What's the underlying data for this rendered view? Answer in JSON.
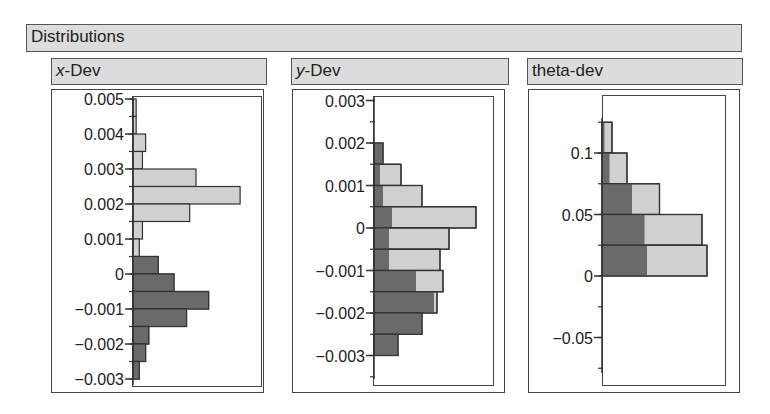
{
  "section": {
    "title": "Distributions"
  },
  "panels": [
    {
      "title_italic": "x",
      "title_rest": "-Dev"
    },
    {
      "title_italic": "y",
      "title_rest": "-Dev"
    },
    {
      "title_italic": "",
      "title_rest": "theta-dev"
    }
  ],
  "colors": {
    "light_bar": "#d0d0d0",
    "dark_bar": "#6a6a6a",
    "header_bg": "#dcdcdc",
    "border": "#444444"
  },
  "chart_data": [
    {
      "type": "bar",
      "orientation": "horizontal-histogram",
      "title": "x-Dev",
      "ylabel": "x-Dev",
      "ylim": [
        -0.0032,
        0.0052
      ],
      "tick_labels": [
        "0.005",
        "0.004",
        "0.003",
        "0.002",
        "0.001",
        "0",
        "−0.001",
        "−0.002",
        "−0.003"
      ],
      "tick_values": [
        0.005,
        0.004,
        0.003,
        0.002,
        0.001,
        0,
        -0.001,
        -0.002,
        -0.003
      ],
      "bins": [
        {
          "low": 0.0045,
          "high": 0.005,
          "total": 1,
          "dark": 0
        },
        {
          "low": 0.004,
          "high": 0.0045,
          "total": 1,
          "dark": 0
        },
        {
          "low": 0.0035,
          "high": 0.004,
          "total": 4,
          "dark": 0
        },
        {
          "low": 0.003,
          "high": 0.0035,
          "total": 3,
          "dark": 0
        },
        {
          "low": 0.0025,
          "high": 0.003,
          "total": 20,
          "dark": 0
        },
        {
          "low": 0.002,
          "high": 0.0025,
          "total": 34,
          "dark": 0
        },
        {
          "low": 0.0015,
          "high": 0.002,
          "total": 18,
          "dark": 0
        },
        {
          "low": 0.001,
          "high": 0.0015,
          "total": 3,
          "dark": 0
        },
        {
          "low": 0.0005,
          "high": 0.001,
          "total": 2,
          "dark": 0
        },
        {
          "low": 0.0,
          "high": 0.0005,
          "total": 8,
          "dark": 8
        },
        {
          "low": -0.0005,
          "high": 0.0,
          "total": 13,
          "dark": 13
        },
        {
          "low": -0.001,
          "high": -0.0005,
          "total": 24,
          "dark": 24
        },
        {
          "low": -0.0015,
          "high": -0.001,
          "total": 17,
          "dark": 17
        },
        {
          "low": -0.002,
          "high": -0.0015,
          "total": 5,
          "dark": 5
        },
        {
          "low": -0.0025,
          "high": -0.002,
          "total": 4,
          "dark": 4
        },
        {
          "low": -0.003,
          "high": -0.0025,
          "total": 2,
          "dark": 2
        }
      ]
    },
    {
      "type": "bar",
      "orientation": "horizontal-histogram",
      "title": "y-Dev",
      "ylabel": "y-Dev",
      "ylim": [
        -0.0035,
        0.0031
      ],
      "tick_labels": [
        "0.003",
        "0.002",
        "0.001",
        "0",
        "−0.001",
        "−0.002",
        "−0.003"
      ],
      "tick_values": [
        0.003,
        0.002,
        0.001,
        0,
        -0.001,
        -0.002,
        -0.003
      ],
      "bins": [
        {
          "low": 0.0015,
          "high": 0.002,
          "total": 3,
          "dark": 3
        },
        {
          "low": 0.001,
          "high": 0.0015,
          "total": 9,
          "dark": 2
        },
        {
          "low": 0.0005,
          "high": 0.001,
          "total": 16,
          "dark": 3
        },
        {
          "low": 0.0,
          "high": 0.0005,
          "total": 34,
          "dark": 6
        },
        {
          "low": -0.0005,
          "high": 0.0,
          "total": 25,
          "dark": 5
        },
        {
          "low": -0.001,
          "high": -0.0005,
          "total": 22,
          "dark": 5
        },
        {
          "low": -0.0015,
          "high": -0.001,
          "total": 23,
          "dark": 14
        },
        {
          "low": -0.002,
          "high": -0.0015,
          "total": 21,
          "dark": 20
        },
        {
          "low": -0.0025,
          "high": -0.002,
          "total": 16,
          "dark": 16
        },
        {
          "low": -0.003,
          "high": -0.0025,
          "total": 8,
          "dark": 8
        }
      ]
    },
    {
      "type": "bar",
      "orientation": "horizontal-histogram",
      "title": "theta-dev",
      "ylabel": "theta-dev",
      "ylim": [
        -0.085,
        0.14
      ],
      "tick_labels": [
        "0.1",
        "0.05",
        "0",
        "−0.05"
      ],
      "tick_values": [
        0.1,
        0.05,
        0,
        -0.05
      ],
      "bins": [
        {
          "low": 0.1,
          "high": 0.125,
          "total": 4,
          "dark": 1
        },
        {
          "low": 0.075,
          "high": 0.1,
          "total": 10,
          "dark": 3
        },
        {
          "low": 0.05,
          "high": 0.075,
          "total": 23,
          "dark": 12
        },
        {
          "low": 0.025,
          "high": 0.05,
          "total": 40,
          "dark": 17
        },
        {
          "low": 0.0,
          "high": 0.025,
          "total": 42,
          "dark": 18
        },
        {
          "low": -0.025,
          "high": 0.0,
          "total": 0,
          "dark": 0
        }
      ]
    }
  ]
}
